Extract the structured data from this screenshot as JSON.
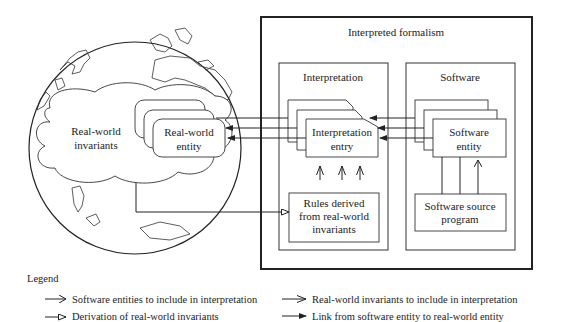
{
  "globe": {
    "cloud_label_line1": "Real-world",
    "cloud_label_line2": "invariants",
    "entity_label_line1": "Real-world",
    "entity_label_line2": "entity"
  },
  "formalism": {
    "title": "Interpreted formalism",
    "interpretation": {
      "title": "Interpretation",
      "entry_line1": "Interpretation",
      "entry_line2": "entry",
      "rules_line1": "Rules derived",
      "rules_line2": "from real-world",
      "rules_line3": "invariants"
    },
    "software": {
      "title": "Software",
      "entity_line1": "Software",
      "entity_line2": "entity",
      "source_line1": "Software source",
      "source_line2": "program"
    }
  },
  "legend": {
    "title": "Legend",
    "items": [
      {
        "label": "Software entities to include in interpretation",
        "arrow": "open-arrow"
      },
      {
        "label": "Real-world invariants to include in interpretation",
        "arrow": "stick-arrow"
      },
      {
        "label": "Derivation of real-world invariants",
        "arrow": "hollow-triangle-arrow"
      },
      {
        "label": "Link from software entity to real-world entity",
        "arrow": "filled-triangle-arrow"
      }
    ]
  }
}
